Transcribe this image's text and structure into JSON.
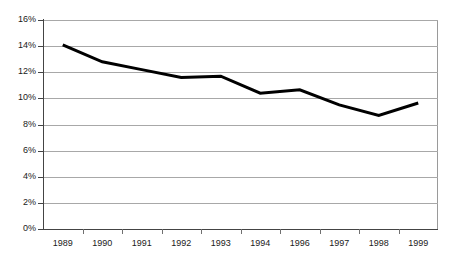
{
  "chart_data": {
    "type": "line",
    "title": "",
    "subtitle": "",
    "xlabel": "",
    "ylabel": "",
    "categories": [
      "1989",
      "1990",
      "1991",
      "1992",
      "1993",
      "1994",
      "1996",
      "1997",
      "1998",
      "1999"
    ],
    "values": [
      14.1,
      12.8,
      12.2,
      11.6,
      11.7,
      10.4,
      10.65,
      9.5,
      8.7,
      9.65
    ],
    "series": [
      {
        "name": "",
        "values": [
          14.1,
          12.8,
          12.2,
          11.6,
          11.7,
          10.4,
          10.65,
          9.5,
          8.7,
          9.65
        ]
      }
    ],
    "ylim": [
      0,
      16
    ],
    "ytick_values": [
      0,
      2,
      4,
      6,
      8,
      10,
      12,
      14,
      16
    ],
    "ytick_labels": [
      "0%",
      "2%",
      "4%",
      "6%",
      "8%",
      "10%",
      "12%",
      "14%",
      "16%"
    ],
    "grid": "horizontal",
    "legend": "none",
    "line_color": "#000000",
    "line_width": 3,
    "grid_color": "#a8a8a8",
    "axis_color": "#444444",
    "background_color": "#ffffff",
    "text_color": "#1a1a1a"
  }
}
